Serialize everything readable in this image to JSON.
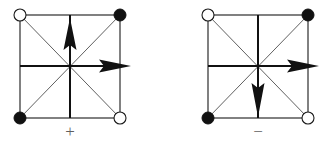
{
  "figure": {
    "caption_left": "+",
    "caption_right": "−",
    "colors": {
      "ink": "#111111",
      "edge": "#1a1a1a",
      "diagonal": "#2b2b2b",
      "label": "#5f5f5f",
      "background": "#ffffff"
    },
    "panels": [
      {
        "id": "panel-plus",
        "sign": "+",
        "square": {
          "left": 20,
          "top": 15,
          "right": 120,
          "bottom": 118
        },
        "center": {
          "x": 70,
          "y": 66
        },
        "nodes": [
          {
            "position": "top-left",
            "fill": "open",
            "x": 20,
            "y": 15
          },
          {
            "position": "top-right",
            "fill": "filled",
            "x": 120,
            "y": 15
          },
          {
            "position": "bottom-left",
            "fill": "filled",
            "x": 20,
            "y": 118
          },
          {
            "position": "bottom-right",
            "fill": "open",
            "x": 120,
            "y": 118
          }
        ],
        "arrows": [
          {
            "name": "vertical-arrow",
            "direction": "up",
            "from": {
              "x": 70,
              "y": 118
            },
            "to": {
              "x": 70,
              "y": 16
            }
          },
          {
            "name": "horizontal-arrow",
            "direction": "right",
            "from": {
              "x": 20,
              "y": 66
            },
            "to": {
              "x": 131,
              "y": 66
            }
          }
        ],
        "diagonals": [
          {
            "name": "diagonal-tl-br",
            "from": {
              "x": 20,
              "y": 15
            },
            "to": {
              "x": 120,
              "y": 118
            }
          },
          {
            "name": "diagonal-bl-tr",
            "from": {
              "x": 20,
              "y": 118
            },
            "to": {
              "x": 120,
              "y": 15
            }
          }
        ]
      },
      {
        "id": "panel-minus",
        "sign": "−",
        "square": {
          "left": 208,
          "top": 15,
          "right": 308,
          "bottom": 118
        },
        "center": {
          "x": 258,
          "y": 66
        },
        "nodes": [
          {
            "position": "top-left",
            "fill": "open",
            "x": 208,
            "y": 15
          },
          {
            "position": "top-right",
            "fill": "filled",
            "x": 308,
            "y": 15
          },
          {
            "position": "bottom-left",
            "fill": "filled",
            "x": 208,
            "y": 118
          },
          {
            "position": "bottom-right",
            "fill": "open",
            "x": 308,
            "y": 118
          }
        ],
        "arrows": [
          {
            "name": "vertical-arrow",
            "direction": "down",
            "from": {
              "x": 258,
              "y": 15
            },
            "to": {
              "x": 258,
              "y": 117
            }
          },
          {
            "name": "horizontal-arrow",
            "direction": "right",
            "from": {
              "x": 208,
              "y": 66
            },
            "to": {
              "x": 319,
              "y": 66
            }
          }
        ],
        "diagonals": [
          {
            "name": "diagonal-tl-br",
            "from": {
              "x": 208,
              "y": 15
            },
            "to": {
              "x": 308,
              "y": 118
            }
          },
          {
            "name": "diagonal-bl-tr",
            "from": {
              "x": 208,
              "y": 118
            },
            "to": {
              "x": 308,
              "y": 15
            }
          }
        ]
      }
    ],
    "node_radius_open": 6,
    "node_radius_filled": 6,
    "label_positions": [
      {
        "for": "panel-plus",
        "x": 70,
        "y": 133
      },
      {
        "for": "panel-minus",
        "x": 258,
        "y": 133
      }
    ]
  }
}
